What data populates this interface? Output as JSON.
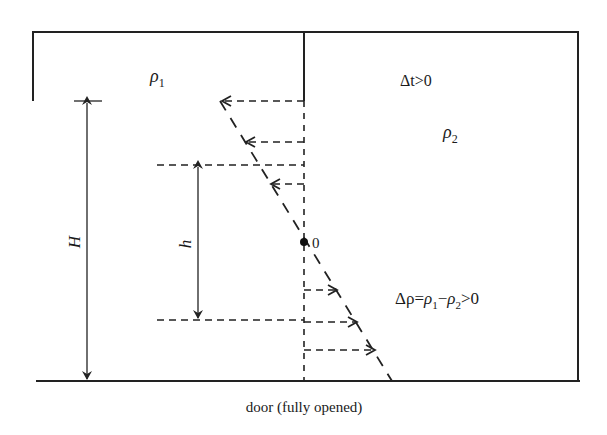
{
  "figure": {
    "type": "door airflow / neutral plane diagram",
    "caption": "door (fully opened)",
    "left_room": {
      "density_label": "ρ",
      "density_sub": "1"
    },
    "right_room": {
      "temp_diff_label": "Δt>0",
      "density_label": "ρ",
      "density_sub": "2"
    },
    "density_difference": {
      "lhs": "Δρ=",
      "rho": "ρ",
      "sub1": "1",
      "minus": "−",
      "sub2": "2",
      "rhs": ">0"
    },
    "dimensions": {
      "total_height_label": "H",
      "neutral_height_label": "h"
    },
    "neutral_point_label": "0",
    "flows": {
      "upper": {
        "direction": "right-to-left",
        "arrow_count": 3
      },
      "lower": {
        "direction": "left-to-right",
        "arrow_count": 3
      }
    }
  }
}
